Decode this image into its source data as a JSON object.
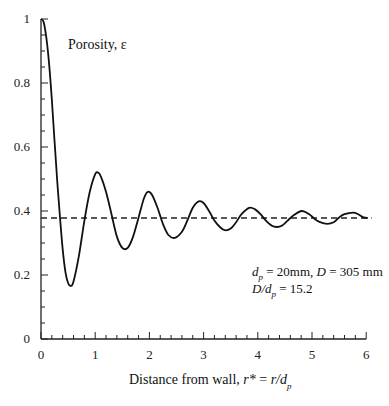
{
  "chart_data": {
    "type": "line",
    "title": "",
    "xlabel": "Distance from wall, r* = r/d_p",
    "xlabel_parts": {
      "prefix": "Distance from wall, ",
      "italic1": "r*",
      "mid": " = ",
      "italic2": "r/d",
      "sub": "p"
    },
    "ylabel": "Porosity, ε",
    "xlim": [
      0,
      6
    ],
    "ylim": [
      0,
      1
    ],
    "x_ticks": [
      0,
      1,
      2,
      3,
      4,
      5,
      6
    ],
    "x_tick_labels": [
      "0",
      "1",
      "2",
      "3",
      "4",
      "5",
      "6"
    ],
    "y_ticks": [
      0,
      0.2,
      0.4,
      0.6,
      0.8,
      1
    ],
    "y_tick_labels": [
      "0",
      "0.2",
      "0.4",
      "0.6",
      "0.8",
      "1"
    ],
    "x_minor_step": 0.2,
    "y_minor_step": 0.05,
    "grid": false,
    "legend": null,
    "series": [
      {
        "name": "Porosity profile",
        "style": "solid",
        "color": "#111111",
        "x": [
          0.0,
          0.05,
          0.1,
          0.15,
          0.2,
          0.25,
          0.3,
          0.35,
          0.4,
          0.45,
          0.5,
          0.55,
          0.6,
          0.7,
          0.8,
          0.9,
          1.0,
          1.05,
          1.1,
          1.2,
          1.3,
          1.4,
          1.5,
          1.6,
          1.7,
          1.8,
          1.9,
          1.97,
          2.05,
          2.15,
          2.25,
          2.35,
          2.47,
          2.6,
          2.7,
          2.8,
          2.91,
          3.0,
          3.1,
          3.2,
          3.3,
          3.39,
          3.5,
          3.6,
          3.7,
          3.84,
          3.95,
          4.05,
          4.15,
          4.25,
          4.35,
          4.45,
          4.55,
          4.65,
          4.81,
          4.95,
          5.05,
          5.15,
          5.28,
          5.4,
          5.5,
          5.6,
          5.76,
          5.85,
          5.95,
          6.03
        ],
        "y": [
          1.0,
          0.99,
          0.94,
          0.86,
          0.75,
          0.62,
          0.49,
          0.38,
          0.28,
          0.21,
          0.175,
          0.166,
          0.18,
          0.26,
          0.37,
          0.46,
          0.515,
          0.52,
          0.51,
          0.46,
          0.39,
          0.32,
          0.285,
          0.285,
          0.32,
          0.38,
          0.44,
          0.46,
          0.45,
          0.41,
          0.36,
          0.325,
          0.316,
          0.335,
          0.37,
          0.41,
          0.43,
          0.425,
          0.4,
          0.37,
          0.35,
          0.34,
          0.345,
          0.365,
          0.39,
          0.41,
          0.405,
          0.39,
          0.37,
          0.355,
          0.35,
          0.355,
          0.37,
          0.385,
          0.4,
          0.39,
          0.375,
          0.365,
          0.36,
          0.365,
          0.38,
          0.39,
          0.395,
          0.39,
          0.38,
          0.378
        ]
      },
      {
        "name": "Mean bulk porosity",
        "style": "dashed",
        "color": "#111111",
        "x": [
          0,
          6.1
        ],
        "y": [
          0.378,
          0.378
        ]
      }
    ],
    "annotations": [
      {
        "text": "d_p = 20mm, D = 305 mm",
        "x": 3.9,
        "y": 0.23
      },
      {
        "text": "D/d_p = 15.2",
        "x": 3.9,
        "y": 0.18
      }
    ]
  },
  "labels": {
    "ylabel": "Porosity, ε",
    "annot1_d": "d",
    "annot1_sub": "p",
    "annot1_rest1": " = 20mm, ",
    "annot1_D": "D",
    "annot1_rest2": " = 305 mm",
    "annot2_D": "D/d",
    "annot2_sub": "p",
    "annot2_rest": " = 15.2",
    "x_prefix": "Distance from wall, ",
    "x_rstar": "r*",
    "x_eq": " = ",
    "x_rd": "r/d",
    "x_sub": "p"
  }
}
